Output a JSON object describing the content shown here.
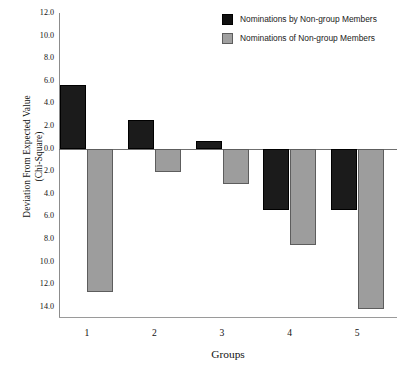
{
  "chart_data": {
    "type": "bar",
    "title": "",
    "xlabel": "Groups",
    "ylabel": "Deviation From Expected Value (Chi-Square)",
    "ylabel_line1": "Deviation From Expected Value",
    "ylabel_line2": "(Chi-Square)",
    "categories": [
      "1",
      "2",
      "3",
      "4",
      "5"
    ],
    "series": [
      {
        "name": "Nominations by Non-group Members",
        "color": "#1b1b1b",
        "values": [
          5.6,
          2.5,
          0.7,
          -5.4,
          -5.4
        ]
      },
      {
        "name": "Nominations of Non-group Members",
        "color": "#9d9d9d",
        "values": [
          -12.7,
          -2.1,
          -3.1,
          -8.5,
          -14.2
        ]
      }
    ],
    "ylim": [
      -15.0,
      12.0
    ],
    "y_ticks": [
      12.0,
      10.0,
      8.0,
      6.0,
      4.0,
      2.0,
      0.0,
      -2.0,
      -4.0,
      -6.0,
      -8.0,
      -10.0,
      -12.0,
      -14.0
    ],
    "y_tick_labels": [
      "12.0",
      "10.0",
      "8.0",
      "6.0",
      "4.0",
      "2.0",
      "0.0",
      "2.0",
      "4.0",
      "6.0",
      "8.0",
      "10.0",
      "12.0",
      "14.0"
    ],
    "grid": false,
    "legend_position": "top-right"
  },
  "legend": {
    "items": [
      {
        "label": "Nominations by Non-group Members",
        "swatch": "dark"
      },
      {
        "label": "Nominations of Non-group Members",
        "swatch": "light"
      }
    ]
  },
  "axes": {
    "x_title": "Groups",
    "y_title_line1": "Deviation From Expected Value",
    "y_title_line2": "(Chi-Square)"
  }
}
